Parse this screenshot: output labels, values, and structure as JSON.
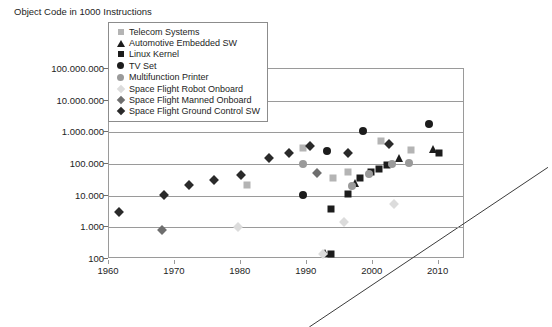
{
  "chart_data": {
    "type": "scatter",
    "title": "Object Code in 1000 Instructions",
    "xlabel": "",
    "ylabel": "",
    "grid": true,
    "legend_position": "top-center",
    "xlim": [
      1960,
      2014
    ],
    "ylim": [
      100,
      100000000
    ],
    "yscale": "log",
    "xticks": [
      1960,
      1970,
      1980,
      1990,
      2000,
      2010
    ],
    "xticklabels": [
      "1960",
      "1970",
      "1980",
      "1990",
      "2000",
      "2010"
    ],
    "yticks": [
      100,
      1000,
      10000,
      100000,
      1000000,
      10000000,
      100000000
    ],
    "yticklabels": [
      "100",
      "1.000",
      "10.000",
      "100.000",
      "1.000.000",
      "10.000.000",
      "100.000.000"
    ],
    "colors": {
      "telecom": "#b4b4b4",
      "automotive": "#1c1c1c",
      "linux": "#1c1c1c",
      "tvset": "#1c1c1c",
      "printer": "#9a9a9a",
      "space_robot": "#dcdcdc",
      "space_manned": "#6e6e6e",
      "space_ground": "#2a2a2a",
      "trendline": "#3c3c3c",
      "grid": "#9a9a9a",
      "frame": "#9a9a9a"
    },
    "trendline": {
      "label": "trend",
      "x": [
        1974.0,
        2010.2
      ],
      "y": [
        100,
        11000000
      ]
    },
    "series": [
      {
        "name": "Telecom Systems",
        "marker": "square",
        "color": "#b4b4b4",
        "points": [
          {
            "x": 1981.0,
            "y": 21000
          },
          {
            "x": 1989.5,
            "y": 330000
          },
          {
            "x": 1994.0,
            "y": 36000
          },
          {
            "x": 1996.2,
            "y": 57000
          },
          {
            "x": 2001.2,
            "y": 540000
          },
          {
            "x": 2005.8,
            "y": 280000
          }
        ]
      },
      {
        "name": "Automotive Embedded SW",
        "marker": "triangle",
        "color": "#1c1c1c",
        "points": [
          {
            "x": 1992.8,
            "y": 155
          },
          {
            "x": 1997.3,
            "y": 25000
          },
          {
            "x": 2004.0,
            "y": 160000
          },
          {
            "x": 2009.2,
            "y": 290000
          }
        ]
      },
      {
        "name": "Linux Kernel",
        "marker": "square",
        "color": "#1c1c1c",
        "points": [
          {
            "x": 1993.6,
            "y": 140
          },
          {
            "x": 1993.6,
            "y": 3800
          },
          {
            "x": 1996.3,
            "y": 11500
          },
          {
            "x": 1998.0,
            "y": 36000
          },
          {
            "x": 1999.8,
            "y": 55000
          },
          {
            "x": 2000.9,
            "y": 68000
          },
          {
            "x": 2002.2,
            "y": 90000
          },
          {
            "x": 2010.0,
            "y": 230000
          }
        ]
      },
      {
        "name": "TV Set",
        "marker": "circle",
        "color": "#1c1c1c",
        "points": [
          {
            "x": 1989.5,
            "y": 10500
          },
          {
            "x": 1993.0,
            "y": 250000
          },
          {
            "x": 1998.5,
            "y": 1100000
          },
          {
            "x": 2008.5,
            "y": 1900000
          }
        ]
      },
      {
        "name": "Multifunction Printer",
        "marker": "circle",
        "color": "#9a9a9a",
        "points": [
          {
            "x": 1989.5,
            "y": 98000
          },
          {
            "x": 1996.8,
            "y": 20000
          },
          {
            "x": 1999.4,
            "y": 47000
          },
          {
            "x": 2003.0,
            "y": 100000
          },
          {
            "x": 2005.5,
            "y": 105000
          }
        ]
      },
      {
        "name": "Space Flight Robot Onboard",
        "marker": "diamond",
        "color": "#dcdcdc",
        "points": [
          {
            "x": 1979.5,
            "y": 1050
          },
          {
            "x": 1992.5,
            "y": 145
          },
          {
            "x": 1995.6,
            "y": 1500
          },
          {
            "x": 2003.2,
            "y": 5500
          }
        ]
      },
      {
        "name": "Space Flight Manned Onboard",
        "marker": "diamond",
        "color": "#6e6e6e",
        "points": [
          {
            "x": 1968.0,
            "y": 800
          },
          {
            "x": 1991.5,
            "y": 52000
          }
        ]
      },
      {
        "name": "Space Flight Ground Control SW",
        "marker": "diamond",
        "color": "#2a2a2a",
        "points": [
          {
            "x": 1961.5,
            "y": 3100
          },
          {
            "x": 1968.3,
            "y": 10200
          },
          {
            "x": 1972.2,
            "y": 21000
          },
          {
            "x": 1976.0,
            "y": 32000
          },
          {
            "x": 1980.0,
            "y": 44000
          },
          {
            "x": 1984.2,
            "y": 150000
          },
          {
            "x": 1987.3,
            "y": 230000
          },
          {
            "x": 1990.5,
            "y": 380000
          },
          {
            "x": 1996.3,
            "y": 230000
          },
          {
            "x": 2002.5,
            "y": 430000
          }
        ]
      }
    ]
  },
  "legend": {
    "items": [
      {
        "label": "Telecom Systems",
        "marker": "square",
        "color": "#b4b4b4"
      },
      {
        "label": "Automotive Embedded SW",
        "marker": "triangle",
        "color": "#1c1c1c"
      },
      {
        "label": "Linux Kernel",
        "marker": "square",
        "color": "#1c1c1c"
      },
      {
        "label": "TV Set",
        "marker": "circle",
        "color": "#1c1c1c"
      },
      {
        "label": "Multifunction Printer",
        "marker": "circle",
        "color": "#9a9a9a"
      },
      {
        "label": "Space Flight Robot Onboard",
        "marker": "diamond",
        "color": "#dcdcdc"
      },
      {
        "label": "Space Flight Manned Onboard",
        "marker": "diamond",
        "color": "#6e6e6e"
      },
      {
        "label": "Space Flight Ground Control SW",
        "marker": "diamond",
        "color": "#2a2a2a"
      }
    ]
  }
}
